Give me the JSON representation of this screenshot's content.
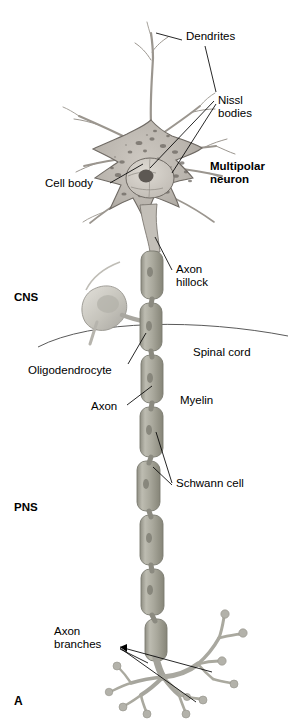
{
  "figure": {
    "panel_label": "A",
    "palette": {
      "soma_fill": "#b9b4ad",
      "soma_edge": "#6f6a64",
      "nissl": "#6d6862",
      "nucleus_fill": "#cfcac3",
      "nucleolus": "#5d5853",
      "dendrite": "#9b968f",
      "myelin_fill": "#a8a79b",
      "myelin_edge": "#7b7a70",
      "glia_fill": "#c8c6bf",
      "terminal_fill": "#a9a8a0",
      "leader_line": "#000000",
      "boundary_line": "#5a5a5a",
      "background": "#ffffff"
    }
  },
  "regions": {
    "cns_label": "CNS",
    "pns_label": "PNS",
    "boundary_label": "Spinal cord"
  },
  "callouts": {
    "dendrites": "Dendrites",
    "nissl_bodies": "Nissl\nbodies",
    "cell_body": "Cell body",
    "multipolar_neuron": "Multipolar\nneuron",
    "axon_hillock": "Axon\nhillock",
    "oligodendrocyte": "Oligodendrocyte",
    "axon": "Axon",
    "myelin": "Myelin",
    "schwann_cell": "Schwann cell",
    "axon_branches": "Axon\nbranches"
  }
}
